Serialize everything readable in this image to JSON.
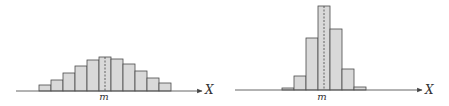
{
  "chart_data": [
    {
      "type": "bar",
      "title": "",
      "description": "Wide, flat symmetric histogram centered at m",
      "xlabel": "X",
      "ylabel": "",
      "mean_label": "m",
      "categories": [
        "1",
        "2",
        "3",
        "4",
        "5",
        "6",
        "7",
        "8",
        "9",
        "10",
        "11"
      ],
      "values": [
        6,
        11,
        18,
        25,
        31,
        34,
        32,
        27,
        20,
        13,
        8
      ],
      "mean_bin_index": 5,
      "grid": false,
      "geometry": {
        "x0": 39,
        "bin_width": 12,
        "baseline": 91,
        "axis_x1": 16,
        "axis_x2": 202,
        "mean_x": 105,
        "label_x": 104,
        "label_y": 100,
        "xlabel_x": 205,
        "xlabel_y": 94
      }
    },
    {
      "type": "bar",
      "title": "",
      "description": "Narrow, peaked symmetric histogram centered at m",
      "xlabel": "X",
      "ylabel": "",
      "mean_label": "m",
      "categories": [
        "1",
        "2",
        "3",
        "4",
        "5",
        "6",
        "7"
      ],
      "values": [
        2,
        14,
        52,
        84,
        61,
        21,
        3
      ],
      "mean_bin_index": 3,
      "grid": false,
      "geometry": {
        "x0": 282,
        "bin_width": 12,
        "baseline": 90,
        "axis_x1": 235,
        "axis_x2": 422,
        "mean_x": 324,
        "label_x": 322,
        "label_y": 100,
        "xlabel_x": 425,
        "xlabel_y": 94
      }
    }
  ],
  "labels": {
    "left_mean": "m",
    "left_axis": "X",
    "right_mean": "m",
    "right_axis": "X"
  }
}
